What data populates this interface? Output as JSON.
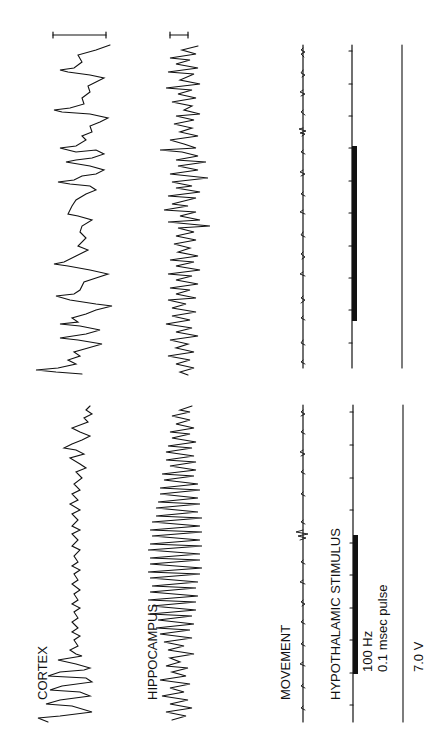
{
  "figure": {
    "orientation": "rotated 90 degrees counter-clockwise (time axis runs bottom-to-top)",
    "panels": [
      {
        "id": "panel-a",
        "position": "lower half",
        "channel_labels": [
          "CORTEX",
          "HIPPOCAMPUS",
          "MOVEMENT",
          "HYPOTHALAMIC STIMULUS"
        ],
        "stimulus_params": {
          "frequency": "100 Hz",
          "pulse": "0.1 msec pulse",
          "voltage": "7.0 V"
        }
      },
      {
        "id": "panel-b",
        "position": "upper half",
        "channel_labels": [],
        "scale_bars": [
          "cortex scale bar",
          "hippocampus scale bar"
        ]
      }
    ]
  },
  "labels": {
    "cortex": "CORTEX",
    "hippocampus": "HIPPOCAMPUS",
    "movement": "MOVEMENT",
    "stimulus": "HYPOTHALAMIC STIMULUS",
    "freq": "100 Hz",
    "pulse": "0.1 msec pulse",
    "voltage": "7.0 V"
  },
  "colors": {
    "trace": "#111111",
    "background": "#ffffff"
  }
}
